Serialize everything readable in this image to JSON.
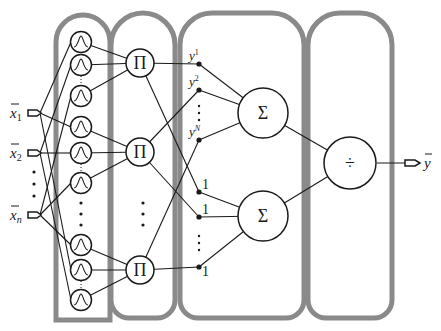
{
  "inputs": [
    {
      "label": "x",
      "sub": "1",
      "y": 113
    },
    {
      "label": "x",
      "sub": "2",
      "y": 153
    },
    {
      "label": "x",
      "sub": "n",
      "y": 215
    }
  ],
  "input_ellipsis": "⋮",
  "layers": {
    "membership": {
      "symbol": "Λ",
      "name": "gaussian-membership-layer"
    },
    "product": {
      "symbol": "Π",
      "name": "product-layer"
    },
    "sum": {
      "symbol": "Σ",
      "name": "summation-layer"
    },
    "divide": {
      "symbol": "÷",
      "name": "division-layer"
    }
  },
  "weights_top": [
    {
      "label": "y",
      "sup": "1"
    },
    {
      "label": "y",
      "sup": "2"
    },
    {
      "label": "y",
      "sup": "N"
    }
  ],
  "weights_bottom": [
    "1",
    "1",
    "1"
  ],
  "output": {
    "label": "y"
  },
  "colors": {
    "capsule": "#8a8a8a",
    "line": "#1a1a1a",
    "background": "#ffffff"
  }
}
